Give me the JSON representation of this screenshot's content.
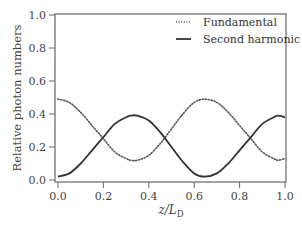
{
  "chart_data": {
    "type": "line",
    "title": "",
    "xlabel": "z/L_D",
    "xlabel_parts": {
      "main": "z/L",
      "sub": "D"
    },
    "ylabel": "Relative photon numbers",
    "xlim": [
      0.0,
      1.0
    ],
    "ylim": [
      0.0,
      1.0
    ],
    "xticks": [
      "0.0",
      "0.2",
      "0.4",
      "0.6",
      "0.8",
      "1.0"
    ],
    "yticks": [
      "0.0",
      "0.2",
      "0.4",
      "0.6",
      "0.8",
      "1.0"
    ],
    "grid": false,
    "legend_position": "upper right",
    "x": [
      0.0,
      0.05,
      0.1,
      0.15,
      0.2,
      0.25,
      0.3,
      0.32,
      0.35,
      0.4,
      0.45,
      0.5,
      0.55,
      0.6,
      0.645,
      0.7,
      0.75,
      0.8,
      0.85,
      0.9,
      0.95,
      0.97,
      1.0
    ],
    "series": [
      {
        "name": "Fundamental",
        "style": "dotted",
        "color": "#555555",
        "values": [
          0.49,
          0.47,
          0.41,
          0.33,
          0.25,
          0.17,
          0.13,
          0.12,
          0.12,
          0.15,
          0.22,
          0.31,
          0.4,
          0.47,
          0.49,
          0.47,
          0.41,
          0.33,
          0.25,
          0.17,
          0.13,
          0.12,
          0.13
        ]
      },
      {
        "name": "Second harmonic",
        "style": "solid",
        "color": "#333333",
        "values": [
          0.02,
          0.04,
          0.1,
          0.18,
          0.26,
          0.34,
          0.38,
          0.39,
          0.39,
          0.36,
          0.29,
          0.2,
          0.11,
          0.04,
          0.02,
          0.04,
          0.1,
          0.18,
          0.26,
          0.34,
          0.38,
          0.39,
          0.38
        ]
      }
    ]
  },
  "legend": {
    "items": [
      {
        "label": "Fundamental",
        "style": "dotted"
      },
      {
        "label": "Second harmonic",
        "style": "solid"
      }
    ]
  },
  "axes": {
    "ylabel": "Relative photon numbers",
    "xlabel_main": "z/L",
    "xlabel_sub": "D"
  },
  "colors": {
    "axis": "#666666",
    "fundamental": "#555555",
    "second_harmonic": "#333333"
  }
}
